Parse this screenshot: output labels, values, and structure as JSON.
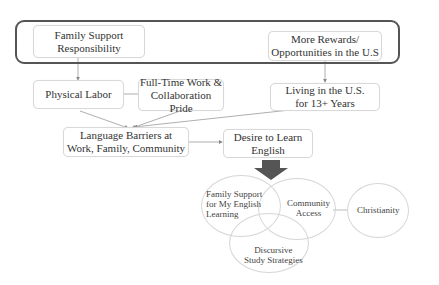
{
  "diagram": {
    "top_group": {
      "boxes": [
        {
          "id": "family_support_responsibility",
          "label_line1": "Family Support",
          "label_line2": "Responsibility"
        },
        {
          "id": "more_rewards",
          "label_line1": "More Rewards/",
          "label_line2": "Opportunities in the U.S"
        }
      ]
    },
    "middle": {
      "physical_labor": {
        "label": "Physical Labor"
      },
      "full_time_work": {
        "label_line1": "Full-Time Work &",
        "label_line2": "Collaboration Pride"
      },
      "living_in_us": {
        "label_line1": "Living in the U.S.",
        "label_line2": "for 13+ Years"
      },
      "language_barriers": {
        "label_line1": "Language Barriers at",
        "label_line2": "Work, Family, Community"
      },
      "desire_to_learn": {
        "label_line1": "Desire to Learn",
        "label_line2": "English"
      }
    },
    "venn": {
      "family_support_learning": {
        "line1": "Family Support",
        "line2": "for My English",
        "line3": "Learning"
      },
      "community_access": {
        "line1": "Community",
        "line2": "Access"
      },
      "discursive_study": {
        "line1": "Discursive",
        "line2": "Study Strategies"
      },
      "christianity": {
        "label": "Christianity"
      }
    },
    "colors": {
      "frame": "#555555",
      "box_border": "#d8d8d8",
      "connector": "#999999",
      "big_arrow": "#555555"
    }
  }
}
